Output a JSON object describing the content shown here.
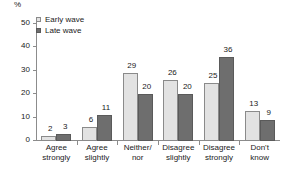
{
  "chart_data": {
    "type": "bar",
    "title": "",
    "xlabel": "",
    "ylabel": "%",
    "ylim": [
      0,
      50
    ],
    "yticks": [
      0,
      10,
      20,
      30,
      40,
      50
    ],
    "grid": false,
    "legend_position": "top-left",
    "categories": [
      "Agree strongly",
      "Agree slightly",
      "Neither/ nor",
      "Disagree slightly",
      "Disagree strongly",
      "Don't know"
    ],
    "category_lines": [
      [
        "Agree",
        "strongly"
      ],
      [
        "Agree",
        "slightly"
      ],
      [
        "Neither/",
        "nor"
      ],
      [
        "Disagree",
        "slightly"
      ],
      [
        "Disagree",
        "strongly"
      ],
      [
        "Don't",
        "know"
      ]
    ],
    "series": [
      {
        "name": "Early wave",
        "color": "#e2e2e2",
        "values": [
          2,
          6,
          29,
          26,
          25,
          13
        ]
      },
      {
        "name": "Late wave",
        "color": "#6e6e6e",
        "values": [
          3,
          11,
          20,
          20,
          36,
          9
        ]
      }
    ]
  },
  "legend": {
    "items": [
      {
        "label": "Early wave"
      },
      {
        "label": "Late wave"
      }
    ]
  },
  "axis": {
    "unit_label": "%",
    "y_tick_labels": [
      "50",
      "40",
      "30",
      "20",
      "10",
      "0"
    ]
  }
}
